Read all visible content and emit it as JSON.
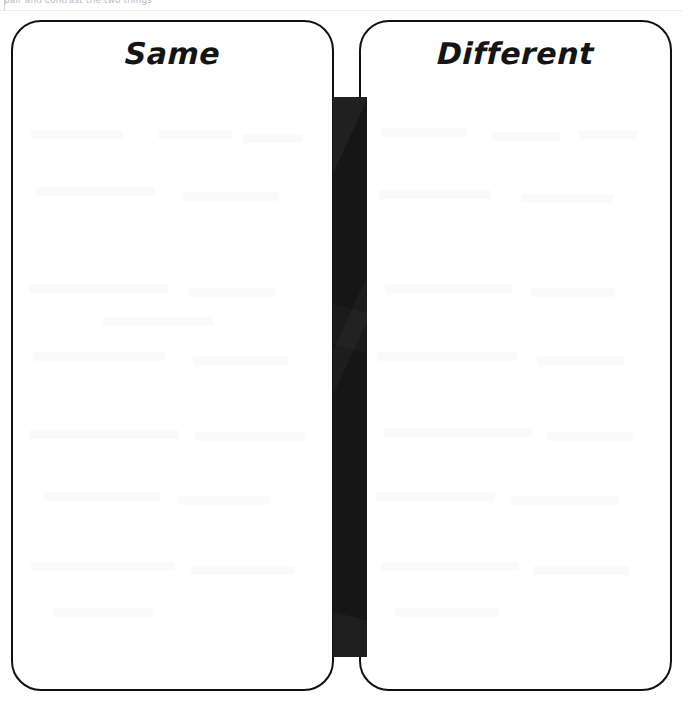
{
  "page": {
    "background_color": "#ffffff",
    "ink_color": "#111111",
    "clipped_instruction_text": "pair and contrast the two things",
    "clipped_instruction_color": "#b9b9c2"
  },
  "worksheet": {
    "type": "venn-diagram-two-column",
    "left_box": {
      "label": "Same",
      "border_color": "#111111",
      "fill_color": "#ffffff"
    },
    "right_box": {
      "label": "Different",
      "border_color": "#111111",
      "fill_color": "#ffffff"
    },
    "overlap_bar": {
      "name": "overlap-region",
      "fill_color": "#161616",
      "content": ""
    }
  },
  "ghost_marks": {
    "description": "faint scanner bleed-through smudges",
    "color": "#fafafb",
    "left_box": [
      {
        "x": 18,
        "y": 108,
        "w": 92
      },
      {
        "x": 145,
        "y": 108,
        "w": 74
      },
      {
        "x": 230,
        "y": 112,
        "w": 60
      },
      {
        "x": 22,
        "y": 165,
        "w": 120
      },
      {
        "x": 170,
        "y": 170,
        "w": 96
      },
      {
        "x": 16,
        "y": 262,
        "w": 140
      },
      {
        "x": 175,
        "y": 266,
        "w": 88
      },
      {
        "x": 90,
        "y": 295,
        "w": 110
      },
      {
        "x": 20,
        "y": 330,
        "w": 132
      },
      {
        "x": 180,
        "y": 334,
        "w": 96
      },
      {
        "x": 16,
        "y": 408,
        "w": 150
      },
      {
        "x": 182,
        "y": 410,
        "w": 110
      },
      {
        "x": 30,
        "y": 470,
        "w": 118
      },
      {
        "x": 165,
        "y": 474,
        "w": 92
      },
      {
        "x": 18,
        "y": 540,
        "w": 144
      },
      {
        "x": 178,
        "y": 544,
        "w": 104
      },
      {
        "x": 40,
        "y": 586,
        "w": 100
      }
    ],
    "right_box": [
      {
        "x": 20,
        "y": 106,
        "w": 86
      },
      {
        "x": 130,
        "y": 110,
        "w": 70
      },
      {
        "x": 218,
        "y": 108,
        "w": 58
      },
      {
        "x": 18,
        "y": 168,
        "w": 112
      },
      {
        "x": 160,
        "y": 172,
        "w": 92
      },
      {
        "x": 24,
        "y": 262,
        "w": 128
      },
      {
        "x": 170,
        "y": 266,
        "w": 84
      },
      {
        "x": 16,
        "y": 330,
        "w": 140
      },
      {
        "x": 176,
        "y": 334,
        "w": 88
      },
      {
        "x": 22,
        "y": 406,
        "w": 150
      },
      {
        "x": 186,
        "y": 410,
        "w": 86
      },
      {
        "x": 14,
        "y": 470,
        "w": 120
      },
      {
        "x": 150,
        "y": 474,
        "w": 108
      },
      {
        "x": 20,
        "y": 540,
        "w": 138
      },
      {
        "x": 172,
        "y": 544,
        "w": 96
      },
      {
        "x": 34,
        "y": 586,
        "w": 104
      }
    ]
  }
}
